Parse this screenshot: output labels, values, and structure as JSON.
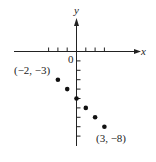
{
  "chart_data": {
    "type": "scatter",
    "title": "",
    "xlabel": "x",
    "ylabel": "y",
    "x": [
      -2,
      -1,
      0,
      1,
      2,
      3
    ],
    "y": [
      -3,
      -4,
      -5,
      -6,
      -7,
      -8
    ],
    "xlim": [
      -3.5,
      7
    ],
    "ylim": [
      -10,
      3.5
    ],
    "x_ticks": [
      -3,
      -2,
      -1,
      1,
      2,
      3
    ],
    "y_ticks": [
      -1,
      -2,
      -3,
      -4,
      -5,
      -6,
      -7,
      -8,
      -9
    ],
    "origin_label": "0",
    "annotations": [
      {
        "text": "(−2, −3)",
        "point": [
          -2,
          -3
        ]
      },
      {
        "text": "(3, −8)",
        "point": [
          3,
          -8
        ]
      }
    ],
    "grid": false,
    "legend": null,
    "point_color": "#111111"
  }
}
